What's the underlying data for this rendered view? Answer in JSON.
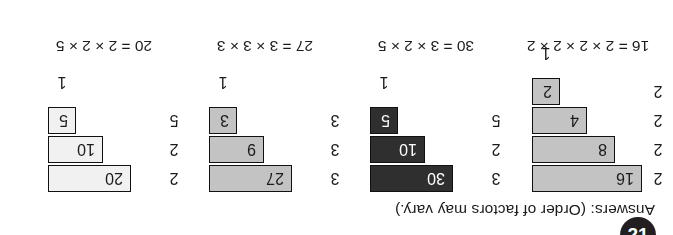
{
  "page": {
    "badge_number": "21",
    "answers_label": "Answers:",
    "answers_note": "(Order of factors may vary.)",
    "answers_full": "Answers: (Order of factors may vary.)"
  },
  "chart_data": {
    "type": "table",
    "title": "Answers: (Order of factors may vary.)",
    "columns": [
      "divisor",
      "quotient"
    ],
    "staircases": [
      {
        "id": "staircase-16",
        "number": 16,
        "equation": "16 = 2 × 2 × 2 × 2",
        "fill": "medium-gray",
        "fill_hex": "#c3c3c3",
        "text_hex": "#1b1b1b",
        "terminator": "1",
        "steps": [
          {
            "divisor": "2",
            "quotient": "16",
            "width": 4
          },
          {
            "divisor": "2",
            "quotient": "8",
            "width": 3
          },
          {
            "divisor": "2",
            "quotient": "4",
            "width": 2
          },
          {
            "divisor": "2",
            "quotient": "2",
            "width": 1
          }
        ]
      },
      {
        "id": "staircase-30",
        "number": 30,
        "equation": "30 = 3 × 2 × 5",
        "fill": "dark",
        "fill_hex": "#2f2f2f",
        "text_hex": "#ffffff",
        "terminator": "1",
        "steps": [
          {
            "divisor": "3",
            "quotient": "30",
            "width": 3
          },
          {
            "divisor": "2",
            "quotient": "10",
            "width": 2
          },
          {
            "divisor": "5",
            "quotient": "5",
            "width": 1
          }
        ]
      },
      {
        "id": "staircase-27",
        "number": 27,
        "equation": "27 = 3 × 3 × 3",
        "fill": "medium-gray",
        "fill_hex": "#c3c3c3",
        "text_hex": "#1b1b1b",
        "terminator": "1",
        "steps": [
          {
            "divisor": "3",
            "quotient": "27",
            "width": 3
          },
          {
            "divisor": "3",
            "quotient": "9",
            "width": 2
          },
          {
            "divisor": "3",
            "quotient": "3",
            "width": 1
          }
        ]
      },
      {
        "id": "staircase-20",
        "number": 20,
        "equation": "20 = 2 × 2 × 5",
        "fill": "near-white",
        "fill_hex": "#f1f1f1",
        "text_hex": "#1b1b1b",
        "terminator": "1",
        "steps": [
          {
            "divisor": "2",
            "quotient": "20",
            "width": 3
          },
          {
            "divisor": "2",
            "quotient": "10",
            "width": 2
          },
          {
            "divisor": "5",
            "quotient": "5",
            "width": 1
          }
        ]
      }
    ]
  }
}
